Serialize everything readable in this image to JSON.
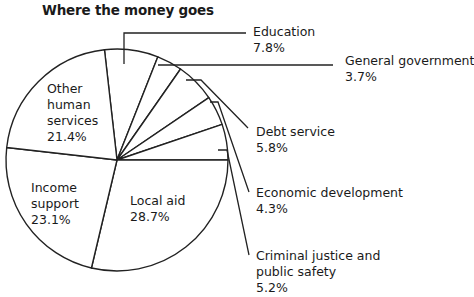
{
  "chart_data": {
    "type": "pie",
    "title": "Where the money goes",
    "start_angle_deg_from_top": -6.48,
    "direction": "clockwise",
    "slices": [
      {
        "label": "Education",
        "value": 7.8,
        "display": "7.8%"
      },
      {
        "label": "General government",
        "value": 3.7,
        "display": "3.7%"
      },
      {
        "label": "Debt service",
        "value": 5.8,
        "display": "5.8%"
      },
      {
        "label": "Economic development",
        "value": 4.3,
        "display": "4.3%"
      },
      {
        "label": "Criminal justice and public safety",
        "value": 5.2,
        "display": "5.2%"
      },
      {
        "label": "Local aid",
        "value": 28.7,
        "display": "28.7%"
      },
      {
        "label": "Income support",
        "value": 23.1,
        "display": "23.1%"
      },
      {
        "label": "Other human services",
        "value": 21.4,
        "display": "21.4%"
      }
    ],
    "fill": "#ffffff",
    "stroke": "#222222"
  },
  "labels": {
    "education": {
      "name": "Education",
      "pct": "7.8%"
    },
    "general_government": {
      "name": "General government",
      "pct": "3.7%"
    },
    "debt_service": {
      "name": "Debt service",
      "pct": "5.8%"
    },
    "economic_development": {
      "name": "Economic development",
      "pct": "4.3%"
    },
    "criminal_justice": {
      "line1": "Criminal justice and",
      "line2": "public safety",
      "pct": "5.2%"
    },
    "local_aid": {
      "name": "Local aid",
      "pct": "28.7%"
    },
    "income_support": {
      "line1": "Income",
      "line2": "support",
      "pct": "23.1%"
    },
    "other_human": {
      "line1": "Other",
      "line2": "human",
      "line3": "services",
      "pct": "21.4%"
    }
  }
}
